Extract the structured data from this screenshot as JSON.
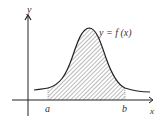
{
  "diagram": {
    "axes": {
      "x_label": "x",
      "y_label": "y"
    },
    "curve_label": "y = f (x)",
    "bounds": {
      "a": "a",
      "b": "b"
    },
    "shaded_region": "area under f(x) from a to b",
    "colors": {
      "stroke": "#222222",
      "hatch": "#555555",
      "background": "#ffffff"
    }
  }
}
